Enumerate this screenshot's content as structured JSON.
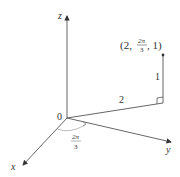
{
  "diagram": {
    "type": "cylindrical-coordinates",
    "axes": {
      "x_label": "x",
      "y_label": "y",
      "z_label": "z",
      "origin_label": "0"
    },
    "point": {
      "label_open": "(2, ",
      "label_frac_num": "2π",
      "label_frac_den": "3",
      "label_close": ", 1)",
      "r": "2",
      "theta_num": "2π",
      "theta_den": "3",
      "z": "1"
    },
    "segment_labels": {
      "radial": "2",
      "height": "1"
    },
    "angle": {
      "num": "2π",
      "den": "3"
    },
    "colors": {
      "line": "#555555",
      "text": "#333333",
      "arc": "#aaaaaa"
    }
  }
}
